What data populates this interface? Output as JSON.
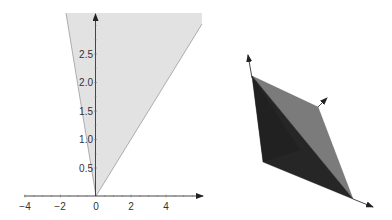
{
  "figures": [
    {
      "id": "cone-2d",
      "kind": "2d-region-plot",
      "axes": {
        "x": {
          "ticks": [
            {
              "value": -4,
              "label": "−4"
            },
            {
              "value": -2,
              "label": "−2"
            },
            {
              "value": 0,
              "label": "0"
            },
            {
              "value": 2,
              "label": "2"
            },
            {
              "value": 4,
              "label": "4"
            }
          ],
          "arrow": true
        },
        "y": {
          "ticks": [
            {
              "value": 0.5,
              "label": "0.5"
            },
            {
              "value": 1.0,
              "label": "1.0"
            },
            {
              "value": 1.5,
              "label": "1.5"
            },
            {
              "value": 2.0,
              "label": "2.0"
            },
            {
              "value": 2.5,
              "label": "2.5"
            }
          ],
          "arrow": true
        }
      },
      "region": {
        "description": "shaded cone with apex at origin",
        "fill": "#e2e2e2",
        "edge": "#9a9a9a"
      }
    },
    {
      "id": "cone-3d",
      "kind": "3d-polyhedral-cone",
      "faces": [
        {
          "name": "light-face",
          "fill": "#7b7b7b"
        },
        {
          "name": "dark-face",
          "fill": "#262626"
        },
        {
          "name": "darker-subface",
          "fill": "#1c1c1c"
        }
      ],
      "axes_arrows": 3
    }
  ],
  "colors": {
    "axis": "#333333",
    "region_fill": "#e2e2e2",
    "region_edge": "#9a9a9a",
    "face_light": "#7b7b7b",
    "face_dark": "#262626"
  }
}
